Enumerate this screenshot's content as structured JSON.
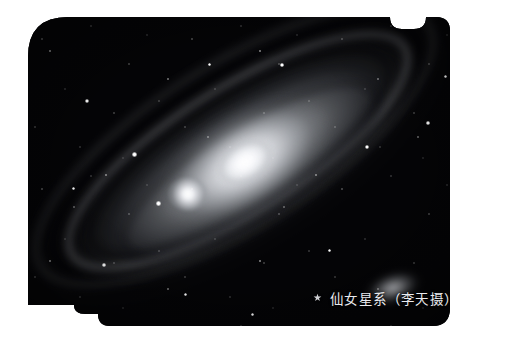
{
  "page": {
    "background_color": "#ffffff",
    "width": 506,
    "height": 343
  },
  "photo": {
    "name": "andromeda-galaxy-photograph",
    "subject": "Andromeda Galaxy (M31)",
    "style": "monochrome astrophotograph",
    "background_color": "#040406",
    "plate_shape": "rounded rectangle with tab at top-right and step notch at bottom-left",
    "objects": [
      {
        "label": "galaxy-core",
        "kind": "bright nucleus"
      },
      {
        "label": "galaxy-disc",
        "kind": "tilted spiral disc with dust lanes"
      },
      {
        "label": "satellite-galaxy-m32",
        "kind": "compact elliptical companion"
      },
      {
        "label": "satellite-galaxy-m110",
        "kind": "diffuse elliptical companion"
      },
      {
        "label": "star-field",
        "kind": "foreground stars"
      }
    ]
  },
  "caption": {
    "star_glyph": "★",
    "text": "仙女星系（李天摄）",
    "color": "#e9eaee"
  }
}
